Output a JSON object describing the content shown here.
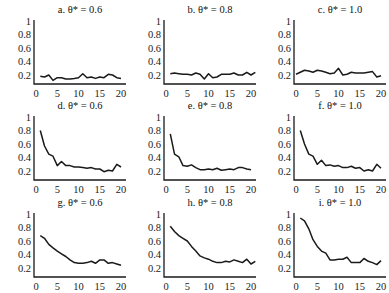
{
  "chart_data": [
    {
      "id": "a",
      "type": "line",
      "title": "a. θ* = 0.6",
      "ylim": [
        0,
        1
      ],
      "xlim": [
        0,
        20
      ],
      "yticks": [
        "1",
        "0.8",
        "0.6",
        "0.4",
        "0.2"
      ],
      "xticks": [
        "0",
        "5",
        "10",
        "15",
        "20"
      ],
      "x": [
        1,
        2,
        3,
        4,
        5,
        6,
        7,
        8,
        9,
        10,
        11,
        12,
        13,
        14,
        15,
        16,
        17,
        18,
        19,
        20
      ],
      "values": [
        0.18,
        0.17,
        0.2,
        0.12,
        0.16,
        0.16,
        0.14,
        0.14,
        0.15,
        0.16,
        0.22,
        0.16,
        0.17,
        0.15,
        0.17,
        0.16,
        0.21,
        0.2,
        0.16,
        0.15
      ]
    },
    {
      "id": "b",
      "type": "line",
      "title": "b. θ* = 0.8",
      "ylim": [
        0,
        1
      ],
      "xlim": [
        0,
        20
      ],
      "yticks": [
        "1",
        "0.8",
        "0.6",
        "0.4",
        "0.2"
      ],
      "xticks": [
        "0",
        "5",
        "10",
        "15",
        "20"
      ],
      "x": [
        1,
        2,
        3,
        4,
        5,
        6,
        7,
        8,
        9,
        10,
        11,
        12,
        13,
        14,
        15,
        16,
        17,
        18,
        19,
        20,
        21
      ],
      "values": [
        0.22,
        0.23,
        0.22,
        0.21,
        0.21,
        0.2,
        0.23,
        0.21,
        0.14,
        0.22,
        0.16,
        0.17,
        0.21,
        0.21,
        0.21,
        0.23,
        0.2,
        0.2,
        0.24,
        0.2,
        0.24
      ]
    },
    {
      "id": "c",
      "type": "line",
      "title": "c. θ* = 1.0",
      "ylim": [
        0,
        1
      ],
      "xlim": [
        0,
        20
      ],
      "yticks": [
        "1",
        "0.8",
        "0.6",
        "0.4",
        "0.2"
      ],
      "xticks": [
        "0",
        "5",
        "10",
        "15",
        "20"
      ],
      "x": [
        0,
        1,
        2,
        3,
        4,
        5,
        6,
        7,
        8,
        9,
        10,
        11,
        12,
        13,
        14,
        15,
        16,
        17,
        18,
        19,
        20
      ],
      "values": [
        0.21,
        0.24,
        0.27,
        0.26,
        0.24,
        0.27,
        0.26,
        0.24,
        0.22,
        0.23,
        0.3,
        0.2,
        0.21,
        0.24,
        0.23,
        0.23,
        0.23,
        0.24,
        0.25,
        0.17,
        0.19
      ]
    },
    {
      "id": "d",
      "type": "line",
      "title": "d. θ* = 0.6",
      "ylim": [
        0,
        1
      ],
      "xlim": [
        0,
        20
      ],
      "yticks": [
        "1",
        "0.8",
        "0.6",
        "0.4",
        "0.2"
      ],
      "xticks": [
        "0",
        "5",
        "10",
        "15",
        "20"
      ],
      "x": [
        1,
        2,
        3,
        4,
        5,
        6,
        7,
        8,
        9,
        10,
        11,
        12,
        13,
        14,
        15,
        16,
        17,
        18,
        19,
        20
      ],
      "values": [
        0.8,
        0.57,
        0.45,
        0.42,
        0.28,
        0.34,
        0.28,
        0.28,
        0.26,
        0.26,
        0.25,
        0.24,
        0.25,
        0.23,
        0.23,
        0.19,
        0.21,
        0.2,
        0.3,
        0.26
      ]
    },
    {
      "id": "e",
      "type": "line",
      "title": "e. θ* = 0.8",
      "ylim": [
        0,
        1
      ],
      "xlim": [
        0,
        20
      ],
      "yticks": [
        "1",
        "0.8",
        "0.6",
        "0.4",
        "0.2"
      ],
      "xticks": [
        "0",
        "5",
        "10",
        "15",
        "20"
      ],
      "x": [
        1,
        2,
        3,
        4,
        5,
        6,
        7,
        8,
        9,
        10,
        11,
        12,
        13,
        14,
        15,
        16,
        17,
        18,
        19,
        20
      ],
      "values": [
        0.75,
        0.45,
        0.41,
        0.28,
        0.27,
        0.29,
        0.25,
        0.22,
        0.22,
        0.23,
        0.22,
        0.24,
        0.21,
        0.22,
        0.23,
        0.22,
        0.25,
        0.25,
        0.23,
        0.22
      ]
    },
    {
      "id": "f",
      "type": "line",
      "title": "f. θ* = 1.0",
      "ylim": [
        0,
        1
      ],
      "xlim": [
        0,
        20
      ],
      "yticks": [
        "1",
        "0.8",
        "0.6",
        "0.4",
        "0.2"
      ],
      "xticks": [
        "0",
        "5",
        "10",
        "15",
        "20"
      ],
      "x": [
        1,
        2,
        3,
        4,
        5,
        6,
        7,
        8,
        9,
        10,
        11,
        12,
        13,
        14,
        15,
        16,
        17,
        18,
        19,
        20
      ],
      "values": [
        0.8,
        0.6,
        0.45,
        0.42,
        0.3,
        0.36,
        0.28,
        0.29,
        0.27,
        0.28,
        0.25,
        0.25,
        0.27,
        0.24,
        0.25,
        0.2,
        0.22,
        0.2,
        0.3,
        0.24
      ]
    },
    {
      "id": "g",
      "type": "line",
      "title": "g. θ* = 0.6",
      "ylim": [
        0,
        1
      ],
      "xlim": [
        0,
        20
      ],
      "yticks": [
        "1",
        "0.8",
        "0.6",
        "0.4",
        "0.2"
      ],
      "xticks": [
        "0",
        "5",
        "10",
        "15",
        "20"
      ],
      "x": [
        1,
        2,
        3,
        4,
        5,
        6,
        7,
        8,
        9,
        10,
        11,
        12,
        13,
        14,
        15,
        16,
        17,
        18,
        19,
        20
      ],
      "values": [
        0.68,
        0.64,
        0.55,
        0.5,
        0.45,
        0.41,
        0.37,
        0.32,
        0.28,
        0.27,
        0.27,
        0.28,
        0.3,
        0.27,
        0.32,
        0.32,
        0.27,
        0.28,
        0.26,
        0.24
      ]
    },
    {
      "id": "h",
      "type": "line",
      "title": "h. θ* = 0.8",
      "ylim": [
        0,
        1
      ],
      "xlim": [
        0,
        20
      ],
      "yticks": [
        "1",
        "0.8",
        "0.6",
        "0.4",
        "0.2"
      ],
      "xticks": [
        "0",
        "5",
        "10",
        "15",
        "20"
      ],
      "x": [
        1,
        2,
        3,
        4,
        5,
        6,
        7,
        8,
        9,
        10,
        11,
        12,
        13,
        14,
        15,
        16,
        17,
        18,
        19,
        20,
        21
      ],
      "values": [
        0.82,
        0.74,
        0.68,
        0.64,
        0.6,
        0.52,
        0.45,
        0.38,
        0.35,
        0.33,
        0.3,
        0.28,
        0.28,
        0.3,
        0.29,
        0.32,
        0.3,
        0.28,
        0.33,
        0.26,
        0.3
      ]
    },
    {
      "id": "i",
      "type": "line",
      "title": "i. θ* = 1.0",
      "ylim": [
        0,
        1
      ],
      "xlim": [
        0,
        20
      ],
      "yticks": [
        "1",
        "0.8",
        "0.6",
        "0.4",
        "0.2"
      ],
      "xticks": [
        "0",
        "5",
        "10",
        "15",
        "20"
      ],
      "x": [
        1,
        2,
        3,
        4,
        5,
        6,
        7,
        8,
        9,
        10,
        11,
        12,
        13,
        14,
        15,
        16,
        17,
        18,
        19,
        20
      ],
      "values": [
        0.94,
        0.9,
        0.78,
        0.62,
        0.52,
        0.45,
        0.42,
        0.32,
        0.32,
        0.33,
        0.33,
        0.36,
        0.28,
        0.28,
        0.28,
        0.34,
        0.3,
        0.28,
        0.25,
        0.31
      ]
    }
  ],
  "style": {
    "line_color": "#1a1a1a",
    "axis_color": "#1a1a1a"
  }
}
